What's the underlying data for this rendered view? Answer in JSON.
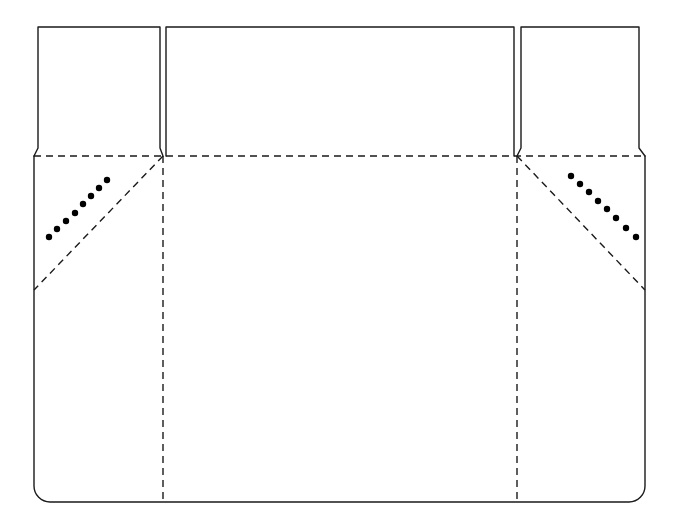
{
  "diagram": {
    "type": "packaging-dieline",
    "canvas": {
      "width": 678,
      "height": 532,
      "background": "#ffffff"
    },
    "style": {
      "cut_color": "#1a1a1a",
      "fold_color": "#1a1a1a",
      "dot_color": "#000000",
      "cut_stroke_width": 1.4,
      "fold_stroke_width": 1.4,
      "fold_dash": "7,5",
      "dot_radius": 3.2
    },
    "geometry": {
      "body": {
        "left": 34,
        "right": 645,
        "top": 156,
        "bottom": 502,
        "corner_radius": 16
      },
      "flap_left": {
        "top": 26,
        "bottom": 156,
        "top_left": 38,
        "top_right": 160,
        "base_left": 34,
        "base_right": 163
      },
      "flap_center": {
        "top": 26,
        "bottom": 156,
        "left": 166,
        "right": 514
      },
      "flap_right": {
        "top": 26,
        "bottom": 156,
        "top_left": 521,
        "top_right": 639,
        "base_left": 517,
        "base_right": 645
      },
      "fold_horizontal": {
        "y": 156,
        "x1": 34,
        "x2": 645
      },
      "fold_vertical_left": {
        "x": 163,
        "y1": 156,
        "y2": 502
      },
      "fold_vertical_right": {
        "x": 517,
        "y1": 156,
        "y2": 502
      },
      "fold_diagonal_left": {
        "x1": 163,
        "y1": 156,
        "x2": 34,
        "y2": 290
      },
      "fold_diagonal_right": {
        "x1": 517,
        "y1": 156,
        "x2": 645,
        "y2": 290
      }
    },
    "glue_dots_left": [
      {
        "cx": 49,
        "cy": 237
      },
      {
        "cx": 57,
        "cy": 229
      },
      {
        "cx": 66,
        "cy": 221
      },
      {
        "cx": 75,
        "cy": 213
      },
      {
        "cx": 83,
        "cy": 204
      },
      {
        "cx": 91,
        "cy": 196
      },
      {
        "cx": 99,
        "cy": 188
      },
      {
        "cx": 107,
        "cy": 180
      }
    ],
    "glue_dots_right": [
      {
        "cx": 571,
        "cy": 176
      },
      {
        "cx": 580,
        "cy": 184
      },
      {
        "cx": 589,
        "cy": 192
      },
      {
        "cx": 598,
        "cy": 201
      },
      {
        "cx": 607,
        "cy": 209
      },
      {
        "cx": 616,
        "cy": 218
      },
      {
        "cx": 626,
        "cy": 228
      },
      {
        "cx": 636,
        "cy": 237
      }
    ],
    "paths": {
      "flap_left_outline": "M 34 156 L 38 148 L 38 27 L 160 27 L 160 148 L 163 156",
      "flap_center_outline": "M 166 156 L 166 27 L 514 27 L 514 156",
      "flap_right_outline": "M 517 156 L 521 148 L 521 27 L 639 27 L 639 148 L 645 156",
      "body_outline": "M 34 156 L 34 486 A 16 16 0 0 0 50 502 L 629 502 A 16 16 0 0 0 645 486 L 645 156"
    }
  }
}
